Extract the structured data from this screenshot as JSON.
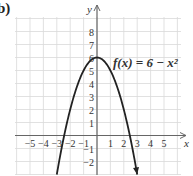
{
  "part_label": "b)",
  "chart_data": {
    "type": "line",
    "title": "",
    "function_label": "f(x) = 6 − x²",
    "function": "6 - x^2",
    "xlabel": "x",
    "ylabel": "y",
    "xlim": [
      -6,
      6
    ],
    "ylim": [
      -3,
      9
    ],
    "grid": true,
    "x_ticks": [
      -5,
      -4,
      -3,
      -2,
      -1,
      1,
      2,
      3,
      4,
      5
    ],
    "y_ticks": [
      -2,
      -1,
      1,
      2,
      3,
      4,
      5,
      6,
      7,
      8
    ],
    "x": [
      -3,
      -2.5,
      -2,
      -1.5,
      -1,
      -0.5,
      0,
      0.5,
      1,
      1.5,
      2,
      2.5,
      3
    ],
    "series": [
      {
        "name": "f(x) = 6 − x²",
        "values": [
          -3,
          -0.25,
          2,
          3.75,
          5,
          5.75,
          6,
          5.75,
          5,
          3.75,
          2,
          -0.25,
          -3
        ]
      }
    ],
    "vertex": [
      0,
      6
    ],
    "x_intercepts": [
      -2.449,
      2.449
    ],
    "ends_with_arrows": true
  },
  "colors": {
    "curve": "#222222",
    "axis": "#666666",
    "grid": "#d9d9d9",
    "text": "#333333"
  }
}
